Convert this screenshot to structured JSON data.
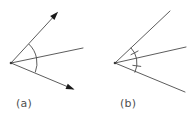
{
  "figure": {
    "background_color": "#ffffff",
    "stroke_color": "#4a4a4a",
    "arrow_color": "#1a1a1a",
    "label_color": "#4f4f4f",
    "panels": [
      {
        "id": "panel-a",
        "label": "(a)",
        "label_x": 16,
        "label_y": 107,
        "vertex": {
          "x": 11,
          "y": 63
        },
        "has_arrowheads": true,
        "has_congruence_ticks": false,
        "rays": [
          {
            "name": "upper-ray",
            "end_x": 57,
            "end_y": 13,
            "arrowhead": true
          },
          {
            "name": "middle-ray",
            "end_x": 83,
            "end_y": 48,
            "arrowhead": false
          },
          {
            "name": "lower-ray",
            "end_x": 73,
            "end_y": 89,
            "arrowhead": true
          }
        ],
        "arcs": [
          {
            "name": "upper-arc",
            "radius": 26,
            "start_angle_deg": -47,
            "end_angle_deg": -11,
            "ticks": 0
          },
          {
            "name": "lower-arc",
            "radius": 26,
            "start_angle_deg": -11,
            "end_angle_deg": 21,
            "ticks": 0
          }
        ]
      },
      {
        "id": "panel-b",
        "label": "(b)",
        "label_x": 120,
        "label_y": 107,
        "vertex": {
          "x": 115,
          "y": 63
        },
        "has_arrowheads": false,
        "has_congruence_ticks": true,
        "rays": [
          {
            "name": "upper-ray",
            "end_x": 170,
            "end_y": 11,
            "arrowhead": false
          },
          {
            "name": "middle-ray",
            "end_x": 186,
            "end_y": 47,
            "arrowhead": false
          },
          {
            "name": "lower-ray",
            "end_x": 185,
            "end_y": 92,
            "arrowhead": false
          }
        ],
        "arcs": [
          {
            "name": "upper-arc",
            "radius": 22,
            "start_angle_deg": -44,
            "end_angle_deg": -11,
            "ticks": 1
          },
          {
            "name": "lower-arc",
            "radius": 22,
            "start_angle_deg": -11,
            "end_angle_deg": 26,
            "ticks": 1
          }
        ]
      }
    ]
  }
}
